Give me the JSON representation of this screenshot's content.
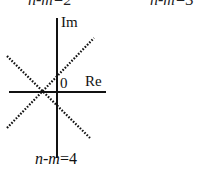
{
  "diagram": {
    "type": "root-locus-asymptotes",
    "top_clipped_labels": [
      "n-m=2",
      "n-m=3"
    ],
    "axes": {
      "imag_label": "Im",
      "real_label": "Re",
      "origin_label": "0"
    },
    "caption": {
      "n": "n",
      "dash": "-",
      "m": "m",
      "eq": "=4"
    },
    "asymptote_count": 4,
    "asymptote_angles_deg": [
      45,
      135,
      225,
      315
    ],
    "colors": {
      "line": "#111111",
      "background": "#ffffff"
    }
  }
}
